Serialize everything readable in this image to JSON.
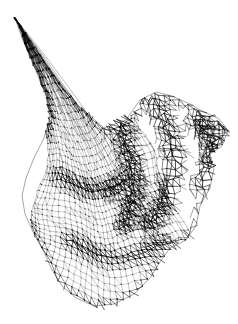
{
  "figure": {
    "kind": "wireframe-mesh-render",
    "title": "3D polygonal wireframe mesh surface",
    "caption": "Quad-dominant remeshed organic drapery surface shown as black wireframe on white background",
    "width": 238,
    "height": 324,
    "background_color": "#ffffff",
    "line_color": "#101010",
    "vertex_color": "#000000",
    "line_width_thin": 0.45,
    "line_width_normal": 0.6,
    "line_width_fold": 0.85,
    "shading": "none",
    "fill": "none",
    "projection": "perspective",
    "visible_text": "",
    "bounding_box": {
      "x_min": 14,
      "y_min": 16,
      "x_max": 228,
      "y_max": 307
    },
    "apex_point": {
      "x": 15,
      "y": 18
    }
  },
  "chart_data": {
    "type": "scatter",
    "title": "",
    "xlabel": "",
    "ylabel": "",
    "grid": false,
    "legend": null,
    "xlim": [
      0,
      238
    ],
    "ylim": [
      0,
      324
    ],
    "regions": [
      {
        "name": "upper-sail",
        "description": "Thin curved sail sweeping down-right from sharp apex at top-left",
        "density": "sparse",
        "tone": "light",
        "cell_size": 13,
        "bounds": [
          14,
          16,
          140,
          130
        ]
      },
      {
        "name": "upper-body",
        "description": "Broad convex shell with irregular quad and pentagon cells",
        "density": "medium",
        "tone": "medium",
        "cell_size": 11,
        "bounds": [
          50,
          70,
          180,
          170
        ]
      },
      {
        "name": "central-fold-band",
        "description": "Dark compressed silhouette fold running vertically through center",
        "density": "dense",
        "tone": "dark",
        "cell_size": 5,
        "bounds": [
          105,
          85,
          150,
          230
        ]
      },
      {
        "name": "right-ridge",
        "description": "Dense dark ridge along upper-right silhouette boundary",
        "density": "dense",
        "tone": "dark",
        "cell_size": 5,
        "bounds": [
          150,
          85,
          228,
          150
        ]
      },
      {
        "name": "right-nose",
        "description": "Dark protruding nose-like lobe on the far right",
        "density": "dense",
        "tone": "dark",
        "cell_size": 4.5,
        "bounds": [
          196,
          112,
          228,
          165
        ]
      },
      {
        "name": "right-horseshoe",
        "description": "U-shaped concave pocket with dark rims on the lower right",
        "density": "dense",
        "tone": "dark",
        "cell_size": 6,
        "bounds": [
          140,
          150,
          215,
          245
        ]
      },
      {
        "name": "left-lobe",
        "description": "Rounded left bulge with clear quad cells and visible vertices",
        "density": "medium",
        "tone": "medium",
        "cell_size": 12,
        "bounds": [
          22,
          150,
          100,
          250
        ]
      },
      {
        "name": "lower-skirt",
        "description": "Lower quad grid skirt curving to the bottom boundary",
        "density": "medium",
        "tone": "medium",
        "cell_size": 12,
        "bounds": [
          45,
          230,
          170,
          307
        ]
      }
    ],
    "silhouette": [
      [
        15,
        18
      ],
      [
        30,
        40
      ],
      [
        52,
        72
      ],
      [
        78,
        105
      ],
      [
        104,
        128
      ],
      [
        126,
        120
      ],
      [
        140,
        100
      ],
      [
        156,
        92
      ],
      [
        172,
        96
      ],
      [
        190,
        104
      ],
      [
        204,
        112
      ],
      [
        218,
        118
      ],
      [
        228,
        130
      ],
      [
        222,
        146
      ],
      [
        210,
        154
      ],
      [
        214,
        168
      ],
      [
        210,
        188
      ],
      [
        200,
        206
      ],
      [
        196,
        226
      ],
      [
        186,
        240
      ],
      [
        170,
        248
      ],
      [
        160,
        262
      ],
      [
        150,
        278
      ],
      [
        134,
        294
      ],
      [
        114,
        304
      ],
      [
        94,
        306
      ],
      [
        76,
        298
      ],
      [
        62,
        286
      ],
      [
        52,
        270
      ],
      [
        44,
        252
      ],
      [
        34,
        234
      ],
      [
        25,
        214
      ],
      [
        22,
        196
      ],
      [
        26,
        178
      ],
      [
        34,
        158
      ],
      [
        44,
        138
      ],
      [
        50,
        118
      ],
      [
        46,
        96
      ],
      [
        34,
        66
      ],
      [
        22,
        38
      ],
      [
        15,
        18
      ]
    ],
    "fold_curves": [
      [
        [
          112,
          86
        ],
        [
          118,
          108
        ],
        [
          122,
          132
        ],
        [
          128,
          156
        ],
        [
          132,
          180
        ],
        [
          130,
          204
        ],
        [
          124,
          226
        ]
      ],
      [
        [
          150,
          92
        ],
        [
          160,
          112
        ],
        [
          168,
          134
        ],
        [
          172,
          158
        ],
        [
          168,
          182
        ],
        [
          160,
          204
        ],
        [
          150,
          222
        ]
      ],
      [
        [
          196,
          118
        ],
        [
          206,
          132
        ],
        [
          212,
          148
        ],
        [
          208,
          166
        ],
        [
          200,
          182
        ]
      ],
      [
        [
          60,
          176
        ],
        [
          78,
          186
        ],
        [
          96,
          190
        ],
        [
          114,
          186
        ],
        [
          130,
          176
        ]
      ],
      [
        [
          70,
          240
        ],
        [
          92,
          252
        ],
        [
          116,
          258
        ],
        [
          140,
          254
        ],
        [
          160,
          244
        ]
      ]
    ]
  }
}
